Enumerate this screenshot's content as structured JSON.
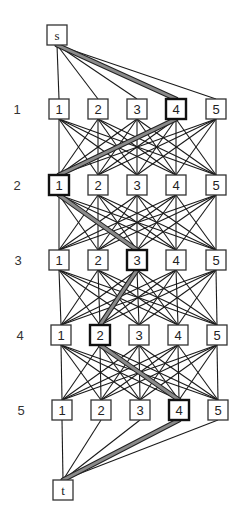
{
  "diagram": {
    "type": "layered-graph",
    "source": {
      "id": "s",
      "label": "s",
      "x": 57,
      "y": 35
    },
    "sink": {
      "id": "t",
      "label": "t",
      "x": 63,
      "y": 490
    },
    "node_size": 20,
    "colors": {
      "edge": "#1a1a1a",
      "highlight_fill": "#8a8a8a",
      "highlight_outline": "#222222",
      "box_border": "#333333"
    },
    "layers": [
      {
        "label": "1",
        "label_x": 17,
        "y": 109,
        "nodes": [
          {
            "label": "1",
            "x": 59
          },
          {
            "label": "2",
            "x": 98
          },
          {
            "label": "3",
            "x": 137
          },
          {
            "label": "4",
            "x": 176,
            "highlight": true
          },
          {
            "label": "5",
            "x": 216
          }
        ]
      },
      {
        "label": "2",
        "label_x": 17,
        "y": 185,
        "nodes": [
          {
            "label": "1",
            "x": 59,
            "highlight": true
          },
          {
            "label": "2",
            "x": 98
          },
          {
            "label": "3",
            "x": 137
          },
          {
            "label": "4",
            "x": 176
          },
          {
            "label": "5",
            "x": 216
          }
        ]
      },
      {
        "label": "3",
        "label_x": 18,
        "y": 260,
        "nodes": [
          {
            "label": "1",
            "x": 59
          },
          {
            "label": "2",
            "x": 98
          },
          {
            "label": "3",
            "x": 137,
            "highlight": true
          },
          {
            "label": "4",
            "x": 176
          },
          {
            "label": "5",
            "x": 216
          }
        ]
      },
      {
        "label": "4",
        "label_x": 20,
        "y": 335,
        "nodes": [
          {
            "label": "1",
            "x": 61
          },
          {
            "label": "2",
            "x": 100,
            "highlight": true
          },
          {
            "label": "3",
            "x": 139
          },
          {
            "label": "4",
            "x": 178
          },
          {
            "label": "5",
            "x": 217
          }
        ]
      },
      {
        "label": "5",
        "label_x": 21,
        "y": 410,
        "nodes": [
          {
            "label": "1",
            "x": 62
          },
          {
            "label": "2",
            "x": 101
          },
          {
            "label": "3",
            "x": 140
          },
          {
            "label": "4",
            "x": 179,
            "highlight": true
          },
          {
            "label": "5",
            "x": 218
          }
        ]
      }
    ],
    "connectivity": "complete-bipartite-between-consecutive-layers",
    "highlighted_path": [
      "s",
      "L1-4",
      "L2-1",
      "L3-3",
      "L4-2",
      "L5-4",
      "t"
    ]
  }
}
